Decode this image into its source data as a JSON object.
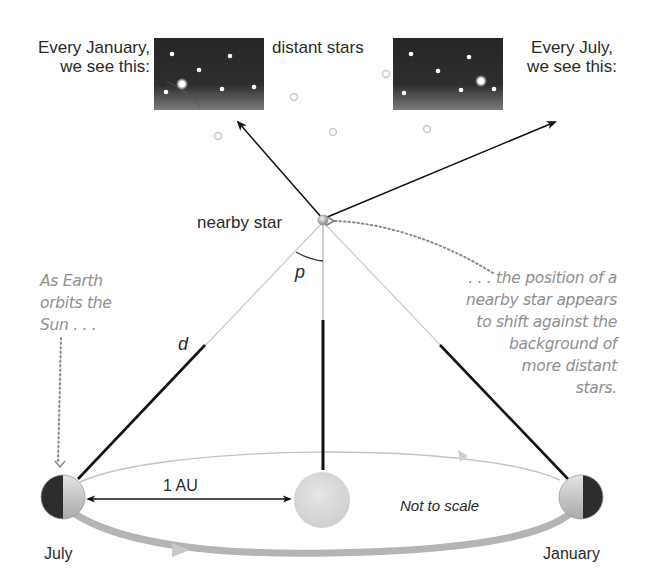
{
  "labels": {
    "january_caption": [
      "Every January,",
      "we see this:"
    ],
    "july_caption": [
      "Every July,",
      "we see this:"
    ],
    "distant_stars": "distant stars",
    "nearby_star": "nearby star",
    "parallax_angle": "p",
    "distance": "d",
    "au": "1 AU",
    "not_to_scale": "Not to scale",
    "july": "July",
    "january": "January"
  },
  "notes": {
    "left": [
      "As Earth",
      "orbits the",
      "Sun . . ."
    ],
    "right": [
      ". . . the position of a",
      "nearby star appears",
      "to shift against the",
      "background of",
      "more distant",
      "stars."
    ]
  },
  "colors": {
    "sky_top": "#262626",
    "sky_bottom": "#6e6e6e",
    "line_dark": "#111111",
    "orbit": "#bdbdbd",
    "note_text": "#8f8f8f",
    "sun": "#dcdcdc"
  },
  "icons": {
    "nearby_star": "sphere-icon",
    "sun": "sun-icon",
    "earth": "earth-icon",
    "distant_star": "ring-icon"
  }
}
